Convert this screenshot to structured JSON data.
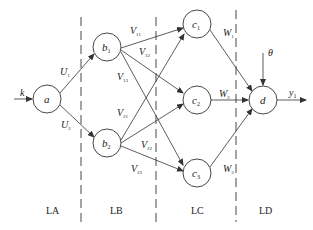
{
  "diagram": {
    "type": "neural-network",
    "input": {
      "label": "k"
    },
    "bias": {
      "label": "θ"
    },
    "output": {
      "label": "y",
      "sub": "1"
    },
    "nodes": {
      "a": {
        "label": "a",
        "sub": ""
      },
      "b1": {
        "label": "b",
        "sub": "1"
      },
      "b2": {
        "label": "b",
        "sub": "2"
      },
      "c1": {
        "label": "c",
        "sub": "1"
      },
      "c2": {
        "label": "c",
        "sub": "2"
      },
      "c3": {
        "label": "c",
        "sub": "3"
      },
      "d": {
        "label": "d",
        "sub": ""
      }
    },
    "weights": {
      "U1": {
        "label": "U",
        "sub": "1"
      },
      "U2": {
        "label": "U",
        "sub": "2"
      },
      "V11": {
        "label": "V",
        "sub": "11"
      },
      "V12": {
        "label": "V",
        "sub": "12"
      },
      "V13": {
        "label": "V",
        "sub": "13"
      },
      "V21": {
        "label": "V",
        "sub": "21"
      },
      "V22": {
        "label": "V",
        "sub": "22"
      },
      "V23": {
        "label": "V",
        "sub": "23"
      },
      "W1": {
        "label": "W",
        "sub": "1"
      },
      "W2": {
        "label": "W",
        "sub": "2"
      },
      "W3": {
        "label": "W",
        "sub": "3"
      }
    },
    "layers": [
      "LA",
      "LB",
      "LC",
      "LD"
    ]
  }
}
